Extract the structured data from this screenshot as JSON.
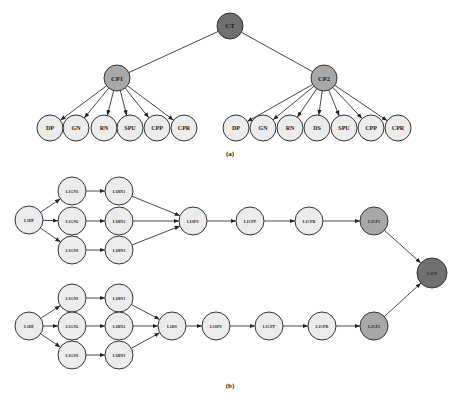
{
  "diagram_a": {
    "caption": "(a)",
    "root": {
      "id": "CT",
      "label": "CT",
      "x": 230,
      "y": 26,
      "r": 13,
      "shade": "dark"
    },
    "parents": [
      {
        "id": "CP1",
        "label": "CP1",
        "x": 117,
        "y": 78,
        "r": 13,
        "shade": "mid"
      },
      {
        "id": "CP2",
        "label": "CP2",
        "x": 324,
        "y": 78,
        "r": 13,
        "shade": "mid"
      }
    ],
    "children": [
      {
        "id": "a1",
        "label": "DP",
        "x": 50,
        "y": 128,
        "parent": "CP1"
      },
      {
        "id": "a2",
        "label": "GN",
        "x": 76,
        "y": 128,
        "parent": "CP1"
      },
      {
        "id": "a3",
        "label": "RN",
        "x": 104,
        "y": 128,
        "parent": "CP1"
      },
      {
        "id": "a4",
        "label": "SPU",
        "x": 130,
        "y": 128,
        "parent": "CP1"
      },
      {
        "id": "a5",
        "label": "CPP",
        "x": 157,
        "y": 128,
        "parent": "CP1"
      },
      {
        "id": "a6",
        "label": "CPR",
        "x": 184,
        "y": 128,
        "parent": "CP1"
      },
      {
        "id": "b1",
        "label": "DP",
        "x": 236,
        "y": 128,
        "parent": "CP2"
      },
      {
        "id": "b2",
        "label": "GN",
        "x": 263,
        "y": 128,
        "parent": "CP2"
      },
      {
        "id": "b3",
        "label": "RN",
        "x": 290,
        "y": 128,
        "parent": "CP2"
      },
      {
        "id": "b4",
        "label": "DS",
        "x": 317,
        "y": 128,
        "parent": "CP2"
      },
      {
        "id": "b5",
        "label": "SPU",
        "x": 344,
        "y": 128,
        "parent": "CP2"
      },
      {
        "id": "b6",
        "label": "CPP",
        "x": 371,
        "y": 128,
        "parent": "CP2"
      },
      {
        "id": "b7",
        "label": "CPR",
        "x": 398,
        "y": 128,
        "parent": "CP2"
      }
    ]
  },
  "diagram_b": {
    "caption": "(b)",
    "nodes": [
      {
        "id": "t_dp",
        "label": "L1DP",
        "x": 29,
        "y": 220,
        "shade": "light"
      },
      {
        "id": "t_gn1",
        "label": "L1GN1",
        "x": 72,
        "y": 191,
        "shade": "light"
      },
      {
        "id": "t_gn2",
        "label": "L1GN2",
        "x": 72,
        "y": 221,
        "shade": "light"
      },
      {
        "id": "t_gn3",
        "label": "L1GN3",
        "x": 72,
        "y": 250,
        "shade": "light"
      },
      {
        "id": "t_rn1",
        "label": "L1RN1",
        "x": 119,
        "y": 191,
        "shade": "light"
      },
      {
        "id": "t_rn2",
        "label": "L1RN2",
        "x": 119,
        "y": 221,
        "shade": "light"
      },
      {
        "id": "t_rn3",
        "label": "L1RN3",
        "x": 119,
        "y": 250,
        "shade": "light"
      },
      {
        "id": "t_spu",
        "label": "L1SPU",
        "x": 193,
        "y": 221,
        "shade": "light"
      },
      {
        "id": "t_cpp",
        "label": "L1CPP",
        "x": 250,
        "y": 221,
        "shade": "light"
      },
      {
        "id": "t_cpr",
        "label": "L1CPR",
        "x": 309,
        "y": 221,
        "shade": "light"
      },
      {
        "id": "t_cp1",
        "label": "L2CP1",
        "x": 374,
        "y": 221,
        "shade": "mid"
      },
      {
        "id": "root",
        "label": "L1CP",
        "x": 432,
        "y": 273,
        "shade": "dark"
      },
      {
        "id": "b_dp",
        "label": "L1DF",
        "x": 29,
        "y": 326,
        "shade": "light"
      },
      {
        "id": "b_gn1",
        "label": "L1GN1",
        "x": 72,
        "y": 298,
        "shade": "light"
      },
      {
        "id": "b_gn2",
        "label": "L1GN2",
        "x": 72,
        "y": 326,
        "shade": "light"
      },
      {
        "id": "b_gn3",
        "label": "L1GN3",
        "x": 72,
        "y": 355,
        "shade": "light"
      },
      {
        "id": "b_rn1",
        "label": "L1RN1",
        "x": 119,
        "y": 298,
        "shade": "light"
      },
      {
        "id": "b_rn2",
        "label": "L1RN2",
        "x": 119,
        "y": 326,
        "shade": "light"
      },
      {
        "id": "b_rn3",
        "label": "L1RN3",
        "x": 119,
        "y": 355,
        "shade": "light"
      },
      {
        "id": "b_ds",
        "label": "L1DS",
        "x": 172,
        "y": 326,
        "shade": "light"
      },
      {
        "id": "b_spu",
        "label": "L1SPU",
        "x": 216,
        "y": 326,
        "shade": "light"
      },
      {
        "id": "b_cpp",
        "label": "L1CPP",
        "x": 269,
        "y": 326,
        "shade": "light"
      },
      {
        "id": "b_cpr",
        "label": "L1CPR",
        "x": 322,
        "y": 326,
        "shade": "light"
      },
      {
        "id": "b_cp2",
        "label": "L2CP2",
        "x": 374,
        "y": 326,
        "shade": "mid"
      }
    ],
    "edges": [
      [
        "t_dp",
        "t_gn1"
      ],
      [
        "t_dp",
        "t_gn2"
      ],
      [
        "t_dp",
        "t_gn3"
      ],
      [
        "t_gn1",
        "t_rn1"
      ],
      [
        "t_gn2",
        "t_rn2"
      ],
      [
        "t_gn3",
        "t_rn3"
      ],
      [
        "t_rn1",
        "t_spu"
      ],
      [
        "t_rn2",
        "t_spu"
      ],
      [
        "t_rn3",
        "t_spu"
      ],
      [
        "t_spu",
        "t_cpp"
      ],
      [
        "t_cpp",
        "t_cpr"
      ],
      [
        "t_cpr",
        "t_cp1"
      ],
      [
        "t_cp1",
        "root"
      ],
      [
        "b_dp",
        "b_gn1"
      ],
      [
        "b_dp",
        "b_gn2"
      ],
      [
        "b_dp",
        "b_gn3"
      ],
      [
        "b_gn1",
        "b_rn1"
      ],
      [
        "b_gn2",
        "b_rn2"
      ],
      [
        "b_gn3",
        "b_rn3"
      ],
      [
        "b_rn1",
        "b_ds"
      ],
      [
        "b_rn2",
        "b_ds"
      ],
      [
        "b_rn3",
        "b_ds"
      ],
      [
        "b_ds",
        "b_spu"
      ],
      [
        "b_spu",
        "b_cpp"
      ],
      [
        "b_cpp",
        "b_cpr"
      ],
      [
        "b_cpr",
        "b_cp2"
      ],
      [
        "b_cp2",
        "root"
      ]
    ]
  }
}
